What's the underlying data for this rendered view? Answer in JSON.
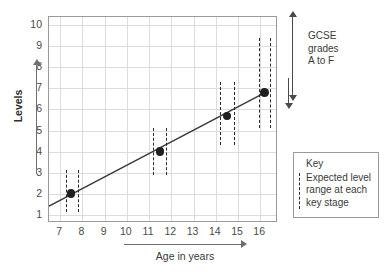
{
  "chart_data": {
    "type": "line",
    "title": "",
    "xlabel": "Age in years",
    "ylabel": "Levels",
    "xlim": [
      6.5,
      16.8
    ],
    "ylim": [
      0.6,
      10.4
    ],
    "xticks": [
      7,
      8,
      9,
      10,
      11,
      12,
      13,
      14,
      15,
      16
    ],
    "yticks": [
      1,
      2,
      3,
      4,
      5,
      6,
      7,
      8,
      9,
      10
    ],
    "grid": true,
    "legend_position": "right-bottom",
    "series": [
      {
        "name": "Expected level at each key stage",
        "x": [
          7.5,
          11.5,
          14.5,
          16.2
        ],
        "values": [
          2.0,
          4.0,
          5.7,
          6.8
        ]
      }
    ],
    "trend_line": {
      "x_start": 6.5,
      "y_start": 1.4,
      "x_end": 16.3,
      "y_end": 6.85
    },
    "range_bars": [
      {
        "x_left": 7.25,
        "x_right": 7.8,
        "y_low": 1.1,
        "y_high": 3.1
      },
      {
        "x_left": 11.2,
        "x_right": 11.75,
        "y_low": 2.9,
        "y_high": 5.1
      },
      {
        "x_left": 14.2,
        "x_right": 14.8,
        "y_low": 4.3,
        "y_high": 7.3
      },
      {
        "x_left": 15.95,
        "x_right": 16.45,
        "y_low": 5.1,
        "y_high": 9.4
      }
    ],
    "annotations": [
      {
        "name": "gcse-range",
        "lines": [
          "GCSE",
          "grades",
          "A to F"
        ]
      }
    ]
  },
  "legend": {
    "title": "Key",
    "entry_lines": [
      "Expected level",
      "range at each",
      "key stage"
    ]
  },
  "axis": {
    "y_title": "Levels",
    "x_title": "Age in years"
  },
  "colors": {
    "frame": "#9a9a9a",
    "grid": "#dcdcdc",
    "marker": "#1f1f1f",
    "line": "#3a3a3a",
    "dashed": "#2a2a2a",
    "text": "#3a3a3a",
    "background": "#ffffff"
  }
}
